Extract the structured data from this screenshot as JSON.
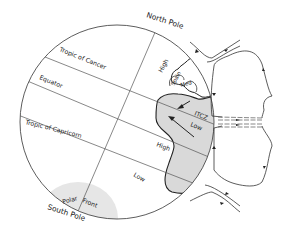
{
  "diagram": {
    "title": "",
    "poles": {
      "north": "North Pole",
      "south": "South Pole"
    },
    "latitudes": {
      "tropic_cancer": "Tropic of Cancer",
      "equator": "Equator",
      "tropic_capricorn": "Tropic of Capricorn"
    },
    "pressure_labels": {
      "high_north": "High",
      "low_itcz": "Low",
      "high_south": "High",
      "low_south": "Low"
    },
    "regions": {
      "spain": "Spain",
      "med": "Med",
      "itcz": "ITCZ",
      "polar_front": "Polar",
      "polar_front_2": "Front"
    },
    "colors": {
      "land_fill": "#d9d9d9",
      "polar_shade": "#e6e6e6",
      "line": "#555555"
    }
  }
}
